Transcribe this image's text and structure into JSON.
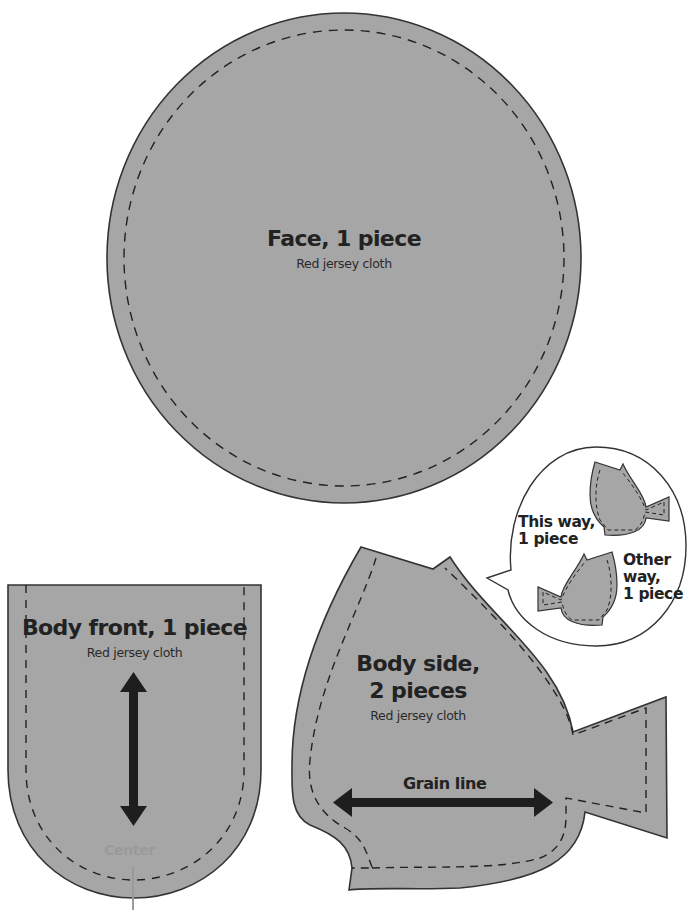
{
  "colors": {
    "fabric_fill": "#a6a6a6",
    "outline": "#333333",
    "stitch_line": "#222222",
    "arrow": "#1e1e1e",
    "center_mark": "#9a9a9a",
    "background": "#ffffff"
  },
  "pieces": {
    "face": {
      "title": "Face, 1 piece",
      "material": "Red jersey cloth"
    },
    "body_front": {
      "title": "Body front, 1 piece",
      "material": "Red jersey cloth",
      "center_label": "Center",
      "grain_arrow": "vertical-double-arrow"
    },
    "body_side": {
      "title_line1": "Body side,",
      "title_line2": "2 pieces",
      "material": "Red jersey cloth",
      "grain_label": "Grain line",
      "grain_arrow": "horizontal-double-arrow"
    }
  },
  "callout": {
    "this_way_line1": "This way,",
    "this_way_line2": "1 piece",
    "other_way_line1": "Other",
    "other_way_line2": "way,",
    "other_way_line3": "1 piece"
  }
}
